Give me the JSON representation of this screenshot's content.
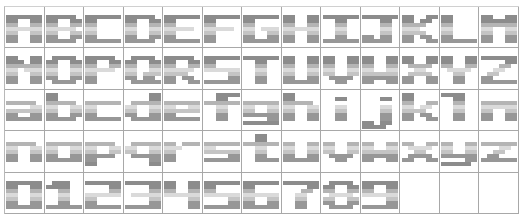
{
  "atlas": {
    "columns": 13,
    "rows": 5,
    "colors": {
      "grid_line": "#a8a8a8",
      "shade_top": "#8c8c8c",
      "shade_upper": "#b4b4b4",
      "shade_mid": "#dadada",
      "shade_lower": "#c4c4c4",
      "shade_bottom": "#979797",
      "background": "#ffffff"
    },
    "cells": [
      "A",
      "B",
      "C",
      "D",
      "E",
      "F",
      "G",
      "H",
      "I",
      "J",
      "K",
      "L",
      "M",
      "N",
      "O",
      "P",
      "Q",
      "R",
      "S",
      "T",
      "U",
      "V",
      "W",
      "X",
      "Y",
      "Z",
      "a",
      "b",
      "c",
      "d",
      "e",
      "f",
      "g",
      "h",
      "i",
      "j",
      "k",
      "l",
      "m",
      "n",
      "o",
      "p",
      "q",
      "r",
      "s",
      "t",
      "u",
      "v",
      "w",
      "x",
      "y",
      "z",
      "0",
      "1",
      "2",
      "3",
      "4",
      "5",
      "6",
      "7",
      "8",
      "9",
      "",
      "",
      ""
    ]
  }
}
